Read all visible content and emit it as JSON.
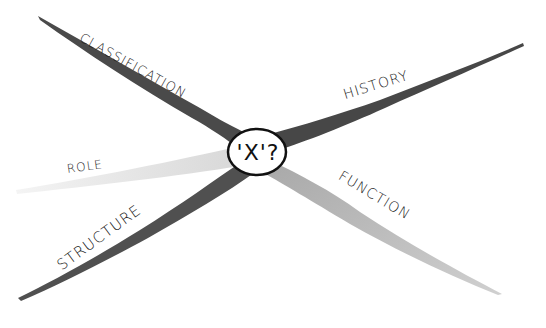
{
  "diagram": {
    "type": "concept-map",
    "center": {
      "label": "'X'?"
    },
    "branches": [
      {
        "id": "classification",
        "label": "CLASSIFICATION",
        "direction": "up-left",
        "shade": "#4a4a4a"
      },
      {
        "id": "history",
        "label": "HISTORY",
        "direction": "up-right",
        "shade": "#4a4a4a"
      },
      {
        "id": "role",
        "label": "ROLE",
        "direction": "left",
        "shade": "#ececec"
      },
      {
        "id": "structure",
        "label": "STRUCTURE",
        "direction": "down-left",
        "shade": "#4f4f4f"
      },
      {
        "id": "function",
        "label": "FUNCTION",
        "direction": "down-right",
        "shade": "#bdbdbd"
      }
    ]
  }
}
